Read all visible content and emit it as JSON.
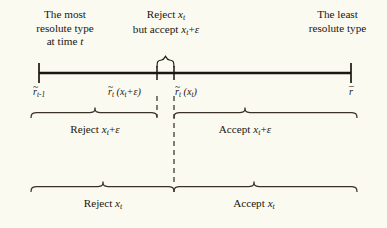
{
  "figure": {
    "background_color": "#fbfaf0",
    "ink_color": "#1a1710",
    "captions": {
      "left_line1": "The most",
      "left_line2": "resolute type",
      "left_line3_prefix": "at time ",
      "left_line3_var": "t",
      "center_line1_prefix": "Reject ",
      "center_line1_var": "x",
      "center_line1_sub": "t",
      "center_line2_prefix": "but accept ",
      "center_line2_var": "x",
      "center_line2_sub": "t",
      "center_line2_suffix": "+",
      "center_line2_eps": "ε",
      "right_line1": "The least",
      "right_line2": "resolute type"
    },
    "axis": {
      "ticks": [
        {
          "name": "r-tilde-t-minus-1",
          "base": "r",
          "accent": "~",
          "sub": "t",
          "sub_suffix": "-1",
          "arg": "",
          "x": 39
        },
        {
          "name": "r-tilde-t-of-xt-plus-eps",
          "base": "r",
          "accent": "~",
          "sub": "t",
          "sub_suffix": "",
          "arg": "(x",
          "arg_sub": "t",
          "arg_tail": "+ε)",
          "x": 157
        },
        {
          "name": "r-tilde-t-of-xt",
          "base": "r",
          "accent": "~",
          "sub": "t",
          "sub_suffix": "",
          "arg": "(x",
          "arg_sub": "t",
          "arg_tail": ")",
          "x": 174
        },
        {
          "name": "r-bar",
          "base": "r",
          "accent": "–",
          "sub": "",
          "sub_suffix": "",
          "arg": "",
          "x": 351
        }
      ]
    },
    "braces": {
      "top_small": {
        "name": "reject-xt-accept-eps-brace",
        "left": 157,
        "right": 174
      },
      "middle_left": {
        "label_prefix": "Reject ",
        "label_var": "x",
        "label_sub": "t",
        "label_suffix": "+",
        "label_eps": "ε"
      },
      "middle_right": {
        "label_prefix": "Accept ",
        "label_var": "x",
        "label_sub": "t",
        "label_suffix": "+",
        "label_eps": "ε"
      },
      "bottom_left": {
        "label_prefix": "Reject ",
        "label_var": "x",
        "label_sub": "t",
        "label_suffix": "",
        "label_eps": ""
      },
      "bottom_right": {
        "label_prefix": "Accept ",
        "label_var": "x",
        "label_sub": "t",
        "label_suffix": "",
        "label_eps": ""
      }
    }
  }
}
